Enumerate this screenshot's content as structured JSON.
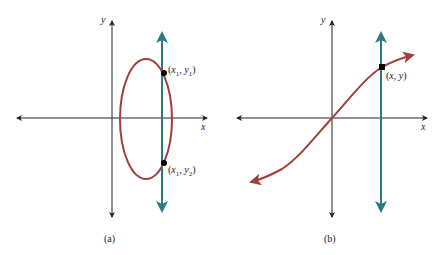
{
  "colors": {
    "axis": "#222222",
    "curve": "#a0403a",
    "vertical_line": "#2a7a80",
    "point": "#000000"
  },
  "panels": [
    {
      "id": "a",
      "caption": "(a)",
      "x_axis_label": "x",
      "y_axis_label": "y",
      "curve": "ellipse",
      "points": [
        {
          "label": "(x1, y1)",
          "x_sym": "x",
          "x_sub": "1",
          "y_sym": "y",
          "y_sub": "1"
        },
        {
          "label": "(x1, y2)",
          "x_sym": "x",
          "x_sub": "1",
          "y_sym": "y",
          "y_sub": "2"
        }
      ]
    },
    {
      "id": "b",
      "caption": "(b)",
      "x_axis_label": "x",
      "y_axis_label": "y",
      "curve": "s-curve through origin",
      "points": [
        {
          "label": "(x, y)",
          "x_sym": "x",
          "y_sym": "y"
        }
      ]
    }
  ]
}
